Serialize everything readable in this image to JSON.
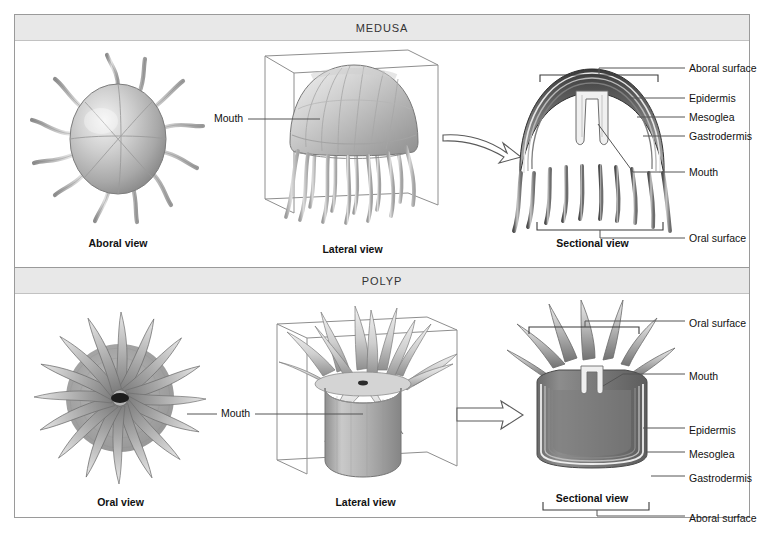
{
  "figure": {
    "panels": [
      {
        "id": "medusa",
        "header": "MEDUSA",
        "views": [
          {
            "id": "aboral",
            "caption": "Aboral view"
          },
          {
            "id": "lateral",
            "caption": "Lateral view"
          },
          {
            "id": "sectional",
            "caption": "Sectional view"
          }
        ],
        "inline_labels": [
          {
            "id": "mouth-lateral",
            "text": "Mouth"
          }
        ],
        "callouts": [
          {
            "id": "aboral-surface",
            "text": "Aboral surface"
          },
          {
            "id": "epidermis",
            "text": "Epidermis"
          },
          {
            "id": "mesoglea",
            "text": "Mesoglea"
          },
          {
            "id": "gastrodermis",
            "text": "Gastrodermis"
          },
          {
            "id": "mouth",
            "text": "Mouth"
          },
          {
            "id": "oral-surface",
            "text": "Oral surface"
          }
        ]
      },
      {
        "id": "polyp",
        "header": "POLYP",
        "views": [
          {
            "id": "oral",
            "caption": "Oral view"
          },
          {
            "id": "lateral",
            "caption": "Lateral view"
          },
          {
            "id": "sectional",
            "caption": "Sectional view"
          }
        ],
        "inline_labels": [
          {
            "id": "mouth-lateral",
            "text": "Mouth"
          }
        ],
        "callouts": [
          {
            "id": "oral-surface",
            "text": "Oral surface"
          },
          {
            "id": "mouth",
            "text": "Mouth"
          },
          {
            "id": "epidermis",
            "text": "Epidermis"
          },
          {
            "id": "mesoglea",
            "text": "Mesoglea"
          },
          {
            "id": "gastrodermis",
            "text": "Gastrodermis"
          },
          {
            "id": "aboral-surface",
            "text": "Aboral surface"
          }
        ]
      }
    ],
    "colors": {
      "header_band": "#e8e8e8",
      "frame_border": "#9a9a9a",
      "leader_line": "#555555",
      "bracket": "#3a3a3a",
      "text": "#111111",
      "organism_light": "#d9d9d9",
      "organism_mid": "#9e9e9e",
      "organism_dark": "#4a4a4a"
    }
  }
}
